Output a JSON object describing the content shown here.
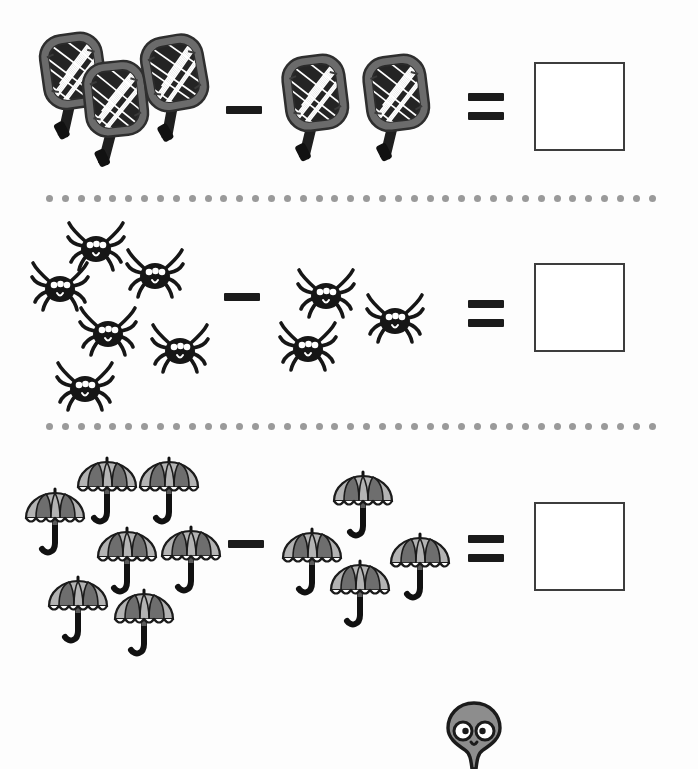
{
  "page": {
    "background_color": "#fdfdfd",
    "width": 698,
    "height": 769
  },
  "style": {
    "operator_color": "#1b1b1b",
    "answer_box_border_color": "#3d3d3d",
    "answer_box_fill": "#ffffff",
    "divider_dot_color": "#9a9a9a",
    "racket_frame_color": "#6b6b6b",
    "racket_handle_color": "#1f1f1f",
    "racket_mesh_color": "#2a2a2a",
    "spider_color": "#161616",
    "spider_eye_color": "#ffffff",
    "umbrella_light_panel": "#b3b3b3",
    "umbrella_dark_panel": "#6e6e6e",
    "umbrella_handle_color": "#111111",
    "mascot_body_color": "#8d8d8d",
    "mascot_outline_color": "#1b1b1b",
    "mascot_eye_color": "#ffffff"
  },
  "operators": {
    "minus_symbol": "minus",
    "equals_symbol": "equals"
  },
  "divider": {
    "dot_count": 39,
    "symbol": "dotted-line"
  },
  "problems": [
    {
      "index": 1,
      "item_name": "racket",
      "item_icon": "racket-icon",
      "minuend": 3,
      "subtrahend": 2,
      "answer": "",
      "answer_placeholder": "",
      "minuend_positions": [
        {
          "x": 36,
          "y": 30,
          "rot": -8,
          "scale": 1.0
        },
        {
          "x": 78,
          "y": 58,
          "rot": -6,
          "scale": 1.0
        },
        {
          "x": 138,
          "y": 32,
          "rot": -10,
          "scale": 1.0
        }
      ],
      "subtrahend_positions": [
        {
          "x": 278,
          "y": 52,
          "rot": -7,
          "scale": 1.0
        },
        {
          "x": 359,
          "y": 52,
          "rot": -7,
          "scale": 1.0
        }
      ],
      "minus_pos": {
        "x": 226,
        "y": 106
      },
      "equals_pos": {
        "x": 468,
        "y": 93
      },
      "answer_box_pos": {
        "x": 534,
        "y": 62
      }
    },
    {
      "index": 2,
      "item_name": "spider",
      "item_icon": "spider-icon",
      "minuend": 6,
      "subtrahend": 3,
      "answer": "",
      "answer_placeholder": "",
      "minuend_positions": [
        {
          "x": 68,
          "y": 13,
          "rot": 0,
          "scale": 1.0
        },
        {
          "x": 32,
          "y": 53,
          "rot": 0,
          "scale": 1.0
        },
        {
          "x": 127,
          "y": 40,
          "rot": 0,
          "scale": 1.0
        },
        {
          "x": 80,
          "y": 98,
          "rot": 0,
          "scale": 1.0
        },
        {
          "x": 152,
          "y": 115,
          "rot": 0,
          "scale": 1.0
        },
        {
          "x": 57,
          "y": 153,
          "rot": 0,
          "scale": 1.0
        }
      ],
      "subtrahend_positions": [
        {
          "x": 298,
          "y": 60,
          "rot": 0,
          "scale": 1.0
        },
        {
          "x": 367,
          "y": 85,
          "rot": 0,
          "scale": 1.0
        },
        {
          "x": 280,
          "y": 113,
          "rot": 0,
          "scale": 1.0
        }
      ],
      "minus_pos": {
        "x": 224,
        "y": 87
      },
      "equals_pos": {
        "x": 468,
        "y": 94
      },
      "answer_box_pos": {
        "x": 534,
        "y": 57
      }
    },
    {
      "index": 3,
      "item_name": "umbrella",
      "item_icon": "umbrella-icon",
      "minuend": 7,
      "subtrahend": 4,
      "answer": "",
      "answer_placeholder": "",
      "minuend_positions": [
        {
          "x": 24,
          "y": 45,
          "rot": 0,
          "scale": 1.0
        },
        {
          "x": 76,
          "y": 14,
          "rot": 0,
          "scale": 1.0
        },
        {
          "x": 138,
          "y": 14,
          "rot": 0,
          "scale": 1.0
        },
        {
          "x": 96,
          "y": 84,
          "rot": 0,
          "scale": 1.0
        },
        {
          "x": 160,
          "y": 83,
          "rot": 0,
          "scale": 1.0
        },
        {
          "x": 47,
          "y": 133,
          "rot": 0,
          "scale": 1.0
        },
        {
          "x": 113,
          "y": 146,
          "rot": 0,
          "scale": 1.0
        }
      ],
      "subtrahend_positions": [
        {
          "x": 332,
          "y": 28,
          "rot": 0,
          "scale": 1.0
        },
        {
          "x": 281,
          "y": 85,
          "rot": 0,
          "scale": 1.0
        },
        {
          "x": 389,
          "y": 90,
          "rot": 0,
          "scale": 1.0
        },
        {
          "x": 329,
          "y": 117,
          "rot": 0,
          "scale": 1.0
        }
      ],
      "minus_pos": {
        "x": 228,
        "y": 100
      },
      "equals_pos": {
        "x": 468,
        "y": 95
      },
      "answer_box_pos": {
        "x": 534,
        "y": 62
      }
    }
  ],
  "mascot": {
    "name": "alien-mascot",
    "description": "gray alien head with large white eyes at page bottom"
  }
}
